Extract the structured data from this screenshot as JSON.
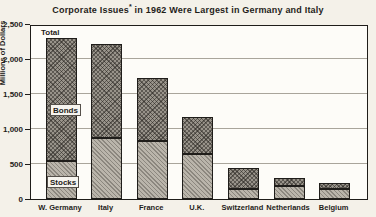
{
  "title": {
    "prefix": "Corporate Issues",
    "asterisk": "*",
    "suffix": " in 1962 Were Largest in Germany and Italy"
  },
  "annotations": {
    "total": "Total",
    "bonds": "Bonds",
    "stocks": "Stocks"
  },
  "colors": {
    "background": "#f4f1e9",
    "ink": "#1f1d1a",
    "grid": "#a9a59b",
    "bonds_fill": "#98938a",
    "stocks_fill": "#bab5ab",
    "label_box": "#f6f4ee"
  },
  "chart_data": {
    "type": "bar",
    "stacked": true,
    "title": "Corporate Issues* in 1962 Were Largest in Germany and Italy",
    "xlabel": "",
    "ylabel": "Millions of Dollars",
    "ylim": [
      0,
      2500
    ],
    "ytick_values": [
      0,
      500,
      1000,
      1500,
      2000,
      2500
    ],
    "ytick_labels": [
      "0",
      "500",
      "1,000",
      "1,500",
      "2,000",
      "2,500"
    ],
    "grid": true,
    "legend_position": "labels-inside-first-bar",
    "categories": [
      "W. Germany",
      "Italy",
      "France",
      "U.K.",
      "Switzerland",
      "Netherlands",
      "Belgium"
    ],
    "series": [
      {
        "name": "Stocks",
        "values": [
          550,
          870,
          830,
          640,
          150,
          185,
          140
        ]
      },
      {
        "name": "Bonds",
        "values": [
          1750,
          1350,
          900,
          535,
          300,
          110,
          90
        ]
      }
    ],
    "totals": [
      2300,
      2220,
      1730,
      1175,
      450,
      295,
      230
    ]
  }
}
